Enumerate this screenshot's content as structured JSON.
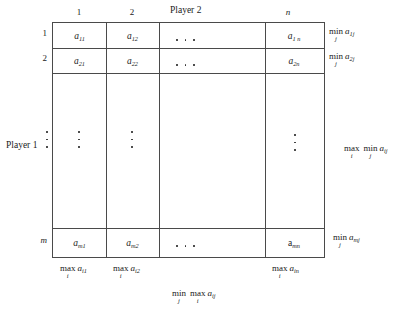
{
  "figure": {
    "type": "payoff-matrix-diagram",
    "player2_label": "Player 2",
    "player1_label": "Player 1",
    "column_headers": [
      "1",
      "2",
      "n"
    ],
    "row_headers": [
      "1",
      "2",
      "m"
    ],
    "matrix_rows": [
      {
        "entries": [
          "a",
          "a",
          "a"
        ],
        "subs": [
          "11",
          "12",
          "1n"
        ]
      },
      {
        "entries": [
          "a",
          "a",
          "a"
        ],
        "subs": [
          "21",
          "22",
          "2n"
        ]
      },
      {
        "entries": [
          "a",
          "a",
          "a"
        ],
        "subs": [
          "m1",
          "m2",
          "mn"
        ]
      }
    ],
    "cells": {
      "a11": {
        "base": "a",
        "sub": "11"
      },
      "a12": {
        "base": "a",
        "sub": "12"
      },
      "a1n": {
        "base": "a",
        "sub": "1 n"
      },
      "a21": {
        "base": "a",
        "sub": "21"
      },
      "a22": {
        "base": "a",
        "sub": "22"
      },
      "a2n": {
        "base": "a",
        "sub": "2n"
      },
      "am1": {
        "base": "a",
        "sub": "m1"
      },
      "am2": {
        "base": "a",
        "sub": "m2"
      },
      "amn": {
        "base": "a",
        "sub": "mn"
      }
    },
    "row_labels_right": [
      {
        "op": "min",
        "index": "j",
        "base": "a",
        "sub": "1j"
      },
      {
        "op": "min",
        "index": "j",
        "base": "a",
        "sub": "2j"
      },
      {
        "op": "min",
        "index": "j",
        "base": "a",
        "sub": "mj"
      }
    ],
    "col_labels_bottom": [
      {
        "op": "max",
        "index": "i",
        "base": "a",
        "sub": "i1"
      },
      {
        "op": "max",
        "index": "i",
        "base": "a",
        "sub": "i2"
      },
      {
        "op": "max",
        "index": "i",
        "base": "a",
        "sub": "in"
      }
    ],
    "maximin": {
      "op1": "max",
      "idx1": "i",
      "op2": "min",
      "idx2": "j",
      "base": "a",
      "sub": "ij"
    },
    "minimax": {
      "op1": "min",
      "idx1": "j",
      "op2": "max",
      "idx2": "i",
      "base": "a",
      "sub": "ij"
    },
    "ellipsis_glyph": "···",
    "line_color": "#4a4a4a",
    "text_color": "#1a1a1a",
    "background_color": "#ffffff"
  }
}
